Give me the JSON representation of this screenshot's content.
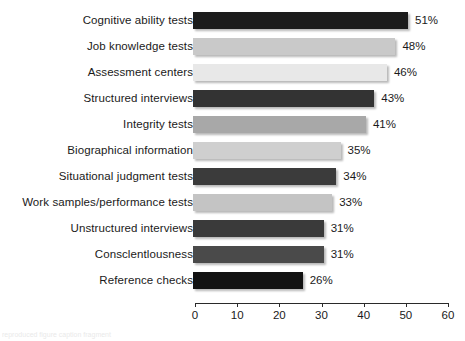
{
  "chart_data": {
    "type": "bar",
    "orientation": "horizontal",
    "title": "",
    "subtitle": "",
    "xlabel": "",
    "ylabel": "",
    "xlim": [
      0,
      60
    ],
    "x_ticks": [
      0,
      10,
      20,
      30,
      40,
      50,
      60
    ],
    "x_tick_labels": [
      "0",
      "10",
      "20",
      "30",
      "40",
      "50",
      "60"
    ],
    "grid": false,
    "legend": false,
    "value_suffix": "%",
    "categories": [
      "Cognitive ability tests",
      "Job knowledge tests",
      "Assessment centers",
      "Structured interviews",
      "Integrity tests",
      "Biographical information",
      "Situational judgment tests",
      "Work samples/performance tests",
      "Unstructured interviews",
      "Consclentlousness",
      "Reference checks"
    ],
    "values": [
      51,
      48,
      46,
      43,
      41,
      35,
      34,
      33,
      31,
      31,
      26
    ],
    "value_labels": [
      "51%",
      "48%",
      "46%",
      "43%",
      "41%",
      "35%",
      "34%",
      "33%",
      "31%",
      "31%",
      "26%"
    ],
    "bar_colors": [
      "#1c1c1c",
      "#c9c9c9",
      "#e8e8e8",
      "#333333",
      "#a8a8a8",
      "#cfcfcf",
      "#3b3b3b",
      "#c4c4c4",
      "#3a3a3a",
      "#4a4a4a",
      "#121212"
    ]
  },
  "bottom_caption": "reproduced figure caption fragment"
}
